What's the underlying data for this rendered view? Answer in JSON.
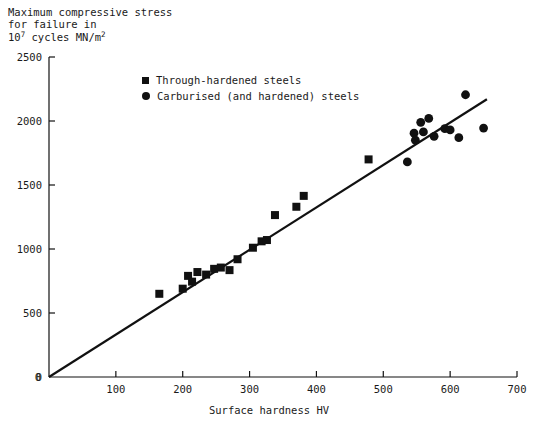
{
  "chart_data": {
    "type": "scatter",
    "title": "",
    "ylabel": "Maximum compressive stress for failure in 10^7 cycles MN/m2",
    "ylabel_lines": [
      "Maximum compressive stress",
      "for failure in",
      "10",
      " cycles MN/m",
      "7",
      "2"
    ],
    "xlabel": "Surface hardness HV",
    "xlim": [
      0,
      700
    ],
    "ylim": [
      0,
      2500
    ],
    "xticks": [
      0,
      100,
      200,
      300,
      400,
      500,
      600,
      700
    ],
    "yticks": [
      0,
      500,
      1000,
      1500,
      2000,
      2500
    ],
    "xtick_labels": [
      "0",
      "100",
      "200",
      "300",
      "400",
      "500",
      "600",
      "700"
    ],
    "ytick_labels": [
      "0",
      "500",
      "1000",
      "1500",
      "2000",
      "2500"
    ],
    "grid": false,
    "legend_position": "upper-left-inside",
    "marker_color": "#111111",
    "line_color": "#111111",
    "series": [
      {
        "name": "Through-hardened steels",
        "marker": "square",
        "points": [
          [
            165,
            650
          ],
          [
            200,
            690
          ],
          [
            208,
            790
          ],
          [
            214,
            745
          ],
          [
            222,
            820
          ],
          [
            235,
            800
          ],
          [
            247,
            845
          ],
          [
            257,
            855
          ],
          [
            270,
            835
          ],
          [
            282,
            920
          ],
          [
            305,
            1010
          ],
          [
            318,
            1060
          ],
          [
            326,
            1070
          ],
          [
            338,
            1265
          ],
          [
            370,
            1330
          ],
          [
            381,
            1415
          ],
          [
            478,
            1700
          ]
        ]
      },
      {
        "name": "Carburised (and hardened) steels",
        "marker": "circle",
        "points": [
          [
            536,
            1680
          ],
          [
            546,
            1905
          ],
          [
            548,
            1850
          ],
          [
            556,
            1990
          ],
          [
            560,
            1915
          ],
          [
            568,
            2020
          ],
          [
            576,
            1880
          ],
          [
            592,
            1940
          ],
          [
            600,
            1930
          ],
          [
            613,
            1870
          ],
          [
            623,
            2205
          ],
          [
            650,
            1945
          ]
        ]
      }
    ],
    "trend_line": {
      "x": [
        0,
        655
      ],
      "y": [
        0,
        2170
      ]
    }
  },
  "legend": {
    "items": [
      {
        "label": "Through-hardened steels",
        "marker": "square"
      },
      {
        "label": "Carburised (and hardened) steels",
        "marker": "circle"
      }
    ]
  }
}
